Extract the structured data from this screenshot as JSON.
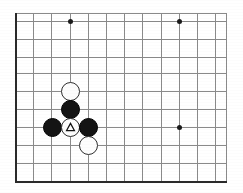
{
  "figure": {
    "title": "Go board diagram",
    "description": "Lower-left corner of a Go board showing a local joseki shape with a triangle-marked white stone",
    "width": 243,
    "height": 193
  },
  "board": {
    "background_color": "#ffffff",
    "line_color": "#8a8a8a",
    "edge_color": "#2a2a2a",
    "star_point_color": "#1a1a1a",
    "grid_origin_x": 15,
    "grid_origin_y": 13,
    "cell_width": 18.2,
    "cell_height": 18.0,
    "vertical_lines": [
      15,
      33,
      51,
      70,
      88,
      106,
      124,
      142,
      161,
      179,
      197,
      215,
      226
    ],
    "horizontal_lines": [
      13,
      21,
      39,
      57,
      73,
      91,
      109,
      127,
      145,
      163,
      181
    ],
    "edges": [
      {
        "name": "left-edge",
        "orientation": "vertical",
        "x": 15,
        "y": 13,
        "length": 170
      },
      {
        "name": "bottom-edge",
        "orientation": "horizontal",
        "x": 15,
        "y": 181,
        "length": 212
      }
    ],
    "star_points": [
      {
        "name": "hoshi-upper-left",
        "x": 70,
        "y": 21
      },
      {
        "name": "hoshi-upper-right",
        "x": 179,
        "y": 21
      },
      {
        "name": "hoshi-lower-right",
        "x": 179,
        "y": 127
      }
    ],
    "stones": [
      {
        "name": "white-stone-top",
        "color": "white",
        "x": 70,
        "y": 91,
        "mark": "none"
      },
      {
        "name": "black-stone-upper",
        "color": "black",
        "x": 70,
        "y": 109,
        "mark": "none"
      },
      {
        "name": "black-stone-left",
        "color": "black",
        "x": 52,
        "y": 127,
        "mark": "none"
      },
      {
        "name": "white-stone-marked",
        "color": "white",
        "x": 70,
        "y": 127,
        "mark": "triangle"
      },
      {
        "name": "black-stone-right",
        "color": "black",
        "x": 88,
        "y": 127,
        "mark": "none"
      },
      {
        "name": "white-stone-bottom",
        "color": "white",
        "x": 88,
        "y": 145,
        "mark": "none"
      }
    ],
    "marks": {
      "triangle_label": "triangle",
      "triangle_color": "#111111"
    }
  }
}
